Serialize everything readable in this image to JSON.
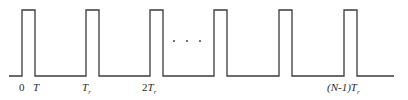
{
  "diagram": {
    "type": "pulse-train",
    "stroke_color": "#3a3a3a",
    "background": "#ffffff",
    "baseline_y": 76,
    "top_y": 10,
    "baseline_start_x": 9,
    "baseline_end_x": 394,
    "pulse_width_px": 13,
    "pulses": [
      {
        "left": 22,
        "right": 35
      },
      {
        "left": 86,
        "right": 99
      },
      {
        "left": 150,
        "right": 163
      },
      {
        "left": 214,
        "right": 227
      },
      {
        "left": 279,
        "right": 292
      },
      {
        "left": 344,
        "right": 357
      }
    ],
    "ellipsis": {
      "text": ". . .",
      "y": 41,
      "xs": [
        174,
        187,
        200
      ]
    },
    "labels": [
      {
        "id": "zero",
        "main": "0",
        "sub": "",
        "italic": false,
        "x": 19,
        "y": 82
      },
      {
        "id": "t",
        "main": "T",
        "sub": "",
        "italic": true,
        "x": 33,
        "y": 82
      },
      {
        "id": "tr",
        "main": "T",
        "sub": "r",
        "italic": true,
        "x": 82,
        "y": 82
      },
      {
        "id": "two-tr",
        "prefix": "2",
        "main": "T",
        "sub": "r",
        "italic": true,
        "x": 142,
        "y": 82
      },
      {
        "id": "n-minus-1-tr",
        "prefix": "(N-1)",
        "main": "T",
        "sub": "r",
        "italic": true,
        "x": 328,
        "y": 82
      }
    ]
  }
}
